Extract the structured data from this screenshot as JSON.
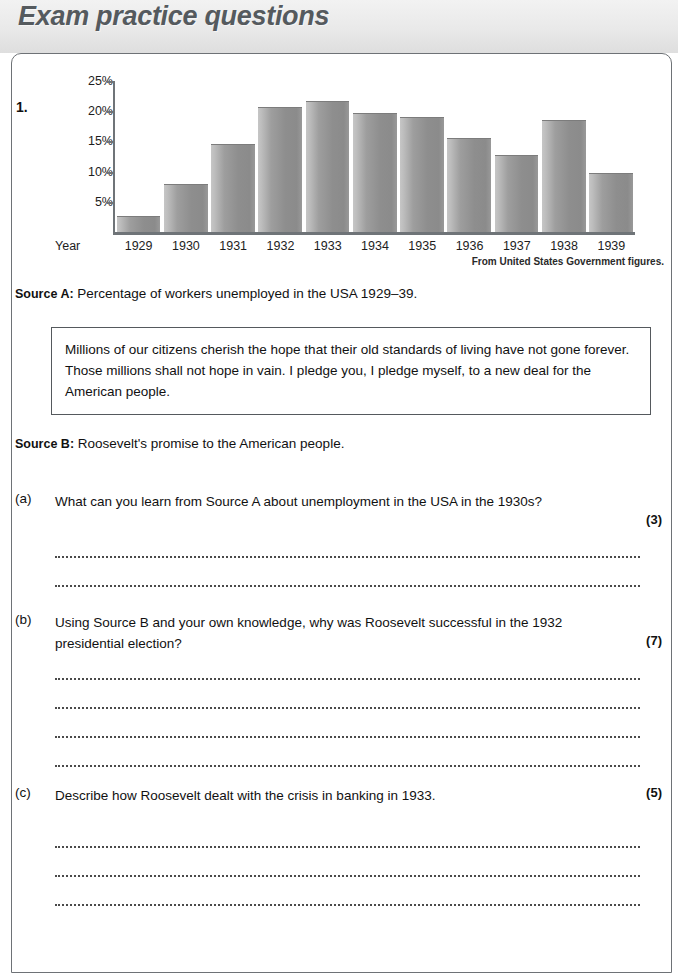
{
  "page": {
    "title": "Exam practice questions",
    "question_number": "1."
  },
  "chart_data": {
    "type": "bar",
    "title": "",
    "xlabel": "Year",
    "ylabel": "",
    "categories": [
      "1929",
      "1930",
      "1931",
      "1932",
      "1933",
      "1934",
      "1935",
      "1936",
      "1937",
      "1938",
      "1939"
    ],
    "values": [
      2.7,
      8.0,
      14.5,
      20.7,
      21.7,
      19.7,
      19.0,
      15.5,
      12.8,
      18.5,
      9.8
    ],
    "ylim": [
      0,
      25
    ],
    "ytick_labels": [
      "25%",
      "20%",
      "15%",
      "10%",
      "5%"
    ],
    "ytick_values": [
      25,
      20,
      15,
      10,
      5
    ],
    "grid": false,
    "legend": "none",
    "credit": "From United States Government figures."
  },
  "sources": [
    {
      "label": "Source A:",
      "text": "Percentage of workers unemployed in the USA 1929–39."
    },
    {
      "label": "Source B:",
      "text": "Roosevelt's promise to the American people."
    }
  ],
  "quote": {
    "text": "Millions of our citizens cherish the hope that their old standards of living have not gone forever. Those millions shall not hope in vain. I pledge you, I pledge myself, to a new deal for the American people."
  },
  "questions": [
    {
      "letter": "(a)",
      "text": "What can you learn from Source A about unemployment in the USA in the 1930s?",
      "marks": "(3)",
      "answer_lines": 2
    },
    {
      "letter": "(b)",
      "text": "Using Source B and your own knowledge, why was Roosevelt successful in the 1932 presidential election?",
      "marks": "(7)",
      "answer_lines": 4
    },
    {
      "letter": "(c)",
      "text": "Describe how Roosevelt dealt with the crisis in banking in 1933.",
      "marks": "(5)",
      "answer_lines": 3
    }
  ],
  "colors": {
    "header_band": "#e9e9e9",
    "title_text": "#555a5e",
    "frame_border": "#6e7276",
    "bar_fill": "#9a9a9a",
    "axis": "#6f7478"
  }
}
